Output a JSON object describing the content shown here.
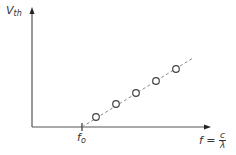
{
  "chart_data": {
    "type": "scatter",
    "title": "",
    "ylabel": {
      "main": "V",
      "sub": "th"
    },
    "xlabel": {
      "main": "f =",
      "num": "c",
      "den": "λ"
    },
    "xtick_label": {
      "main": "f",
      "sub": "o"
    },
    "points": [
      {
        "x": 96,
        "y": 117
      },
      {
        "x": 116,
        "y": 104
      },
      {
        "x": 136,
        "y": 93
      },
      {
        "x": 156,
        "y": 81
      },
      {
        "x": 176,
        "y": 69
      }
    ],
    "fit_line": {
      "style": "dashed",
      "from": [
        82,
        127
      ],
      "to": [
        193,
        58
      ]
    },
    "grid": false,
    "legend": null,
    "colors": {
      "axis": "#555555",
      "points": "#444444",
      "fit": "#888888"
    }
  }
}
